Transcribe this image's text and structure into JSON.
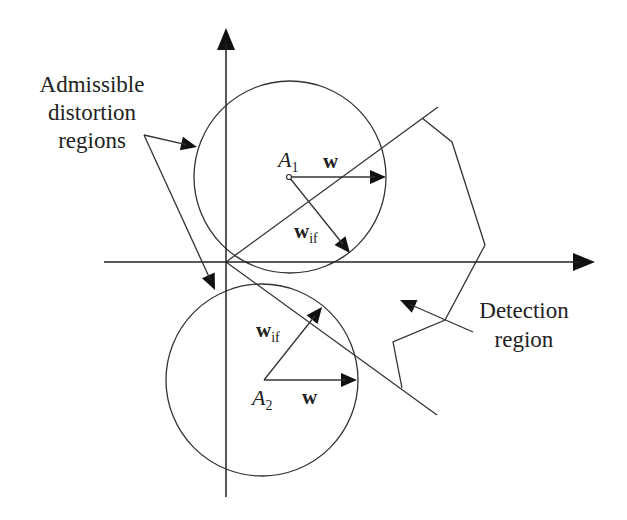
{
  "diagram": {
    "colors": {
      "line": "#333333",
      "text": "#222222",
      "background": "#ffffff"
    },
    "labels": {
      "admissible": [
        "Admissible",
        "distortion",
        "regions"
      ],
      "detection": [
        "Detection",
        "region"
      ],
      "a1": {
        "base": "A",
        "sub": "1"
      },
      "a2": {
        "base": "A",
        "sub": "2"
      },
      "w_top": "w",
      "w_bottom": "w",
      "wif_top": {
        "base": "w",
        "sub": "if"
      },
      "wif_bottom": {
        "base": "w",
        "sub": "if"
      }
    },
    "axes": {
      "origin": [
        226,
        262
      ],
      "x_axis": {
        "from": [
          104,
          262
        ],
        "to": [
          595,
          262
        ]
      },
      "y_axis": {
        "from": [
          226,
          497
        ],
        "to": [
          226,
          28
        ]
      }
    },
    "circles": [
      {
        "name": "circle-a1",
        "cx": 290,
        "cy": 177,
        "r": 96
      },
      {
        "name": "circle-a2",
        "cx": 262,
        "cy": 380,
        "r": 96
      }
    ],
    "boundary_lines": [
      {
        "name": "upper-boundary",
        "from": [
          226,
          262
        ],
        "to": [
          438,
          107
        ]
      },
      {
        "name": "lower-boundary",
        "from": [
          226,
          262
        ],
        "to": [
          437,
          415
        ]
      }
    ],
    "detection_polygon": [
      [
        422,
        118
      ],
      [
        452,
        142
      ],
      [
        485,
        245
      ],
      [
        445,
        320
      ],
      [
        393,
        342
      ],
      [
        402,
        388
      ]
    ],
    "vectors": [
      {
        "name": "w-vector-a1",
        "from": [
          289,
          177
        ],
        "to": [
          386,
          177
        ]
      },
      {
        "name": "wif-vector-a1",
        "from": [
          289,
          177
        ],
        "to": [
          350,
          253
        ]
      },
      {
        "name": "w-vector-a2",
        "from": [
          264,
          380
        ],
        "to": [
          357,
          380
        ]
      },
      {
        "name": "wif-vector-a2",
        "from": [
          264,
          380
        ],
        "to": [
          322,
          307
        ]
      }
    ],
    "pointers": [
      {
        "name": "pointer-to-circle-a1",
        "from": [
          144,
          135
        ],
        "to": [
          197,
          147
        ]
      },
      {
        "name": "pointer-to-circle-a2",
        "from": [
          144,
          135
        ],
        "to": [
          215,
          290
        ]
      },
      {
        "name": "pointer-to-detection",
        "from": [
          473,
          332
        ],
        "to": [
          400,
          300
        ]
      }
    ]
  }
}
